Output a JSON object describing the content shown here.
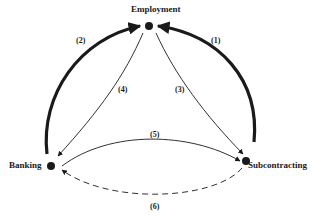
{
  "diagram": {
    "nodes": [
      {
        "id": "employment",
        "label": "Employment"
      },
      {
        "id": "banking",
        "label": "Banking"
      },
      {
        "id": "subcontracting",
        "label": "Subcontracting"
      }
    ],
    "edges": [
      {
        "id": "1",
        "label": "(1)",
        "from": "subcontracting",
        "to": "employment",
        "style": "thick"
      },
      {
        "id": "2",
        "label": "(2)",
        "from": "banking",
        "to": "employment",
        "style": "thick"
      },
      {
        "id": "3",
        "label": "(3)",
        "from": "employment",
        "to": "subcontracting",
        "style": "thin"
      },
      {
        "id": "4",
        "label": "(4)",
        "from": "employment",
        "to": "banking",
        "style": "thin"
      },
      {
        "id": "5",
        "label": "(5)",
        "from": "banking",
        "to": "subcontracting",
        "style": "thin"
      },
      {
        "id": "6",
        "label": "(6)",
        "from": "subcontracting",
        "to": "banking",
        "style": "dashed"
      }
    ],
    "colors": {
      "ink": "#1a1a1a",
      "background": "#ffffff"
    }
  }
}
